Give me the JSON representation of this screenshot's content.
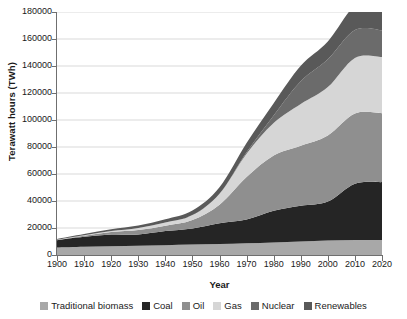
{
  "chart_data": {
    "type": "area",
    "stacked": true,
    "title": "",
    "xlabel": "Year",
    "ylabel": "Terawatt hours (TWh)",
    "x": [
      1900,
      1910,
      1920,
      1930,
      1940,
      1950,
      1960,
      1970,
      1980,
      1990,
      2000,
      2010,
      2020
    ],
    "xlim": [
      1900,
      2020
    ],
    "ylim": [
      0,
      180000
    ],
    "xticks": [
      "1900",
      "1910",
      "1920",
      "1930",
      "1940",
      "1950",
      "1960",
      "1970",
      "1980",
      "1990",
      "2000",
      "2010",
      "2020"
    ],
    "yticks": [
      "0",
      "20000",
      "40000",
      "60000",
      "80000",
      "100000",
      "120000",
      "140000",
      "160000",
      "180000"
    ],
    "ytick_values": [
      0,
      20000,
      40000,
      60000,
      80000,
      100000,
      120000,
      140000,
      160000,
      180000
    ],
    "grid": "horizontal",
    "legend_position": "bottom",
    "series": [
      {
        "name": "Traditional biomass",
        "color": "#a8a8a8",
        "values": [
          5600,
          6100,
          6500,
          6900,
          7300,
          7700,
          8100,
          8700,
          9300,
          10000,
          10800,
          11100,
          11200
        ]
      },
      {
        "name": "Coal",
        "color": "#252525",
        "values": [
          5400,
          7400,
          8700,
          8300,
          10400,
          12000,
          15400,
          17600,
          23400,
          26400,
          28800,
          41700,
          42800
        ]
      },
      {
        "name": "Oil",
        "color": "#8f8f8f",
        "values": [
          200,
          800,
          1800,
          3300,
          4000,
          6200,
          13800,
          31500,
          41000,
          44600,
          49000,
          52000,
          51000
        ]
      },
      {
        "name": "Gas",
        "color": "#d6d6d6",
        "values": [
          100,
          300,
          700,
          1500,
          2400,
          3700,
          8000,
          17200,
          24000,
          30800,
          35800,
          41200,
          41700
        ]
      },
      {
        "name": "Nuclear",
        "color": "#6b6b6b",
        "values": [
          0,
          0,
          0,
          0,
          0,
          0,
          100,
          1100,
          5700,
          16900,
          20600,
          20600,
          19800
        ]
      },
      {
        "name": "Renewables",
        "color": "#595959",
        "values": [
          500,
          900,
          1300,
          1800,
          2300,
          3300,
          4800,
          6900,
          9100,
          11500,
          13200,
          18300,
          25600
        ]
      }
    ],
    "totals": [
      11800,
      15500,
      19000,
      21800,
      26400,
      32900,
      50200,
      83000,
      112500,
      140200,
      158200,
      184900,
      192100
    ]
  },
  "legend": {
    "items": [
      {
        "label": "Traditional biomass",
        "color": "#a8a8a8"
      },
      {
        "label": "Coal",
        "color": "#252525"
      },
      {
        "label": "Oil",
        "color": "#8f8f8f"
      },
      {
        "label": "Gas",
        "color": "#d6d6d6"
      },
      {
        "label": "Nuclear",
        "color": "#6b6b6b"
      },
      {
        "label": "Renewables",
        "color": "#595959"
      }
    ]
  },
  "colors": {
    "axis": "#6f6f6f",
    "grid": "#c9c9c9",
    "text": "#1a1a1a",
    "background": "#ffffff"
  }
}
